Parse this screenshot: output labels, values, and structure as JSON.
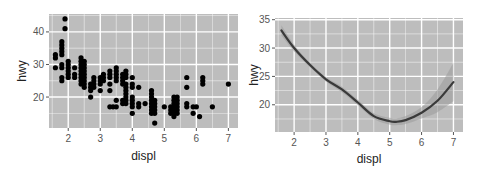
{
  "chart_data": [
    {
      "type": "scatter",
      "title": "",
      "xlabel": "displ",
      "ylabel": "hwy",
      "xlim": [
        1.4,
        7.3
      ],
      "ylim": [
        10.5,
        45.5
      ],
      "x_ticks": [
        2,
        3,
        4,
        5,
        6,
        7
      ],
      "y_ticks": [
        20,
        30,
        40
      ],
      "grid": true,
      "legend": "none",
      "panel_background": "#bdbdbd",
      "point_color": "#000000",
      "points": [
        [
          1.6,
          33
        ],
        [
          1.6,
          32
        ],
        [
          1.6,
          29
        ],
        [
          1.8,
          37
        ],
        [
          1.8,
          36
        ],
        [
          1.8,
          35
        ],
        [
          1.8,
          34
        ],
        [
          1.8,
          33
        ],
        [
          1.8,
          30
        ],
        [
          1.8,
          29
        ],
        [
          1.8,
          26
        ],
        [
          1.8,
          25
        ],
        [
          1.9,
          44
        ],
        [
          1.9,
          41
        ],
        [
          2.0,
          31
        ],
        [
          2.0,
          30
        ],
        [
          2.0,
          29
        ],
        [
          2.0,
          28
        ],
        [
          2.0,
          27
        ],
        [
          2.0,
          26
        ],
        [
          2.2,
          29
        ],
        [
          2.2,
          27
        ],
        [
          2.2,
          26
        ],
        [
          2.4,
          32
        ],
        [
          2.4,
          31
        ],
        [
          2.4,
          30
        ],
        [
          2.4,
          29
        ],
        [
          2.4,
          28
        ],
        [
          2.4,
          27
        ],
        [
          2.4,
          26
        ],
        [
          2.4,
          25
        ],
        [
          2.4,
          24
        ],
        [
          2.5,
          31
        ],
        [
          2.5,
          30
        ],
        [
          2.5,
          29
        ],
        [
          2.5,
          28
        ],
        [
          2.5,
          27
        ],
        [
          2.5,
          26
        ],
        [
          2.5,
          25
        ],
        [
          2.5,
          24
        ],
        [
          2.5,
          23
        ],
        [
          2.7,
          24
        ],
        [
          2.7,
          23
        ],
        [
          2.7,
          22
        ],
        [
          2.7,
          20
        ],
        [
          2.8,
          26
        ],
        [
          2.8,
          25
        ],
        [
          2.8,
          24
        ],
        [
          2.8,
          23
        ],
        [
          3.0,
          26
        ],
        [
          3.0,
          25
        ],
        [
          3.0,
          24
        ],
        [
          3.0,
          22
        ],
        [
          3.1,
          27
        ],
        [
          3.1,
          26
        ],
        [
          3.1,
          25
        ],
        [
          3.3,
          28
        ],
        [
          3.3,
          27
        ],
        [
          3.3,
          26
        ],
        [
          3.3,
          24
        ],
        [
          3.3,
          22
        ],
        [
          3.3,
          17
        ],
        [
          3.4,
          17
        ],
        [
          3.5,
          29
        ],
        [
          3.5,
          28
        ],
        [
          3.5,
          27
        ],
        [
          3.5,
          26
        ],
        [
          3.5,
          25
        ],
        [
          3.5,
          19
        ],
        [
          3.5,
          17
        ],
        [
          3.7,
          27
        ],
        [
          3.7,
          26
        ],
        [
          3.7,
          25
        ],
        [
          3.7,
          24
        ],
        [
          3.7,
          19
        ],
        [
          3.7,
          18
        ],
        [
          3.8,
          28
        ],
        [
          3.8,
          27
        ],
        [
          3.8,
          26
        ],
        [
          3.8,
          24
        ],
        [
          3.8,
          23
        ],
        [
          3.8,
          22
        ],
        [
          3.8,
          21
        ],
        [
          3.8,
          20
        ],
        [
          3.8,
          19
        ],
        [
          3.8,
          18
        ],
        [
          4.0,
          26
        ],
        [
          4.0,
          24
        ],
        [
          4.0,
          23
        ],
        [
          4.0,
          20
        ],
        [
          4.0,
          19
        ],
        [
          4.0,
          18
        ],
        [
          4.0,
          17
        ],
        [
          4.0,
          15
        ],
        [
          4.2,
          23
        ],
        [
          4.2,
          18
        ],
        [
          4.2,
          17
        ],
        [
          4.4,
          18
        ],
        [
          4.6,
          22
        ],
        [
          4.6,
          21
        ],
        [
          4.6,
          20
        ],
        [
          4.6,
          19
        ],
        [
          4.6,
          18
        ],
        [
          4.6,
          17
        ],
        [
          4.6,
          16
        ],
        [
          4.6,
          15
        ],
        [
          4.7,
          19
        ],
        [
          4.7,
          18
        ],
        [
          4.7,
          17
        ],
        [
          4.7,
          16
        ],
        [
          4.7,
          15
        ],
        [
          4.7,
          12
        ],
        [
          5.0,
          17
        ],
        [
          5.2,
          17
        ],
        [
          5.2,
          16
        ],
        [
          5.2,
          15
        ],
        [
          5.3,
          20
        ],
        [
          5.3,
          19
        ],
        [
          5.3,
          18
        ],
        [
          5.3,
          17
        ],
        [
          5.3,
          16
        ],
        [
          5.3,
          15
        ],
        [
          5.3,
          14
        ],
        [
          5.4,
          20
        ],
        [
          5.4,
          19
        ],
        [
          5.4,
          18
        ],
        [
          5.4,
          17
        ],
        [
          5.4,
          16
        ],
        [
          5.4,
          15
        ],
        [
          5.7,
          26
        ],
        [
          5.7,
          23
        ],
        [
          5.7,
          18
        ],
        [
          5.7,
          17
        ],
        [
          5.9,
          17
        ],
        [
          5.9,
          15
        ],
        [
          6.0,
          17
        ],
        [
          6.1,
          14
        ],
        [
          6.2,
          26
        ],
        [
          6.2,
          25
        ],
        [
          6.2,
          24
        ],
        [
          6.5,
          17
        ],
        [
          7.0,
          24
        ]
      ]
    },
    {
      "type": "line",
      "subtype": "smooth (loess) with confidence band",
      "title": "",
      "xlabel": "displ",
      "ylabel": "hwy",
      "xlim": [
        1.4,
        7.3
      ],
      "ylim": [
        15.2,
        35.3
      ],
      "x_ticks": [
        2,
        3,
        4,
        5,
        6,
        7
      ],
      "y_ticks": [
        20,
        25,
        30,
        35
      ],
      "grid": true,
      "legend": "none",
      "panel_background": "#bdbdbd",
      "line_color": "#3a3a3a",
      "band_color": "#9a9a9a",
      "x": [
        1.6,
        2.0,
        2.5,
        3.0,
        3.5,
        4.0,
        4.5,
        5.0,
        5.2,
        5.5,
        6.0,
        6.5,
        7.0
      ],
      "y": [
        33.1,
        30.0,
        27.0,
        24.5,
        22.7,
        20.4,
        18.0,
        17.1,
        17.0,
        17.3,
        18.6,
        20.7,
        24.0
      ],
      "ci_lower": [
        32.2,
        29.4,
        26.6,
        24.1,
        22.2,
        19.9,
        17.5,
        16.5,
        16.4,
        16.6,
        17.6,
        18.7,
        20.6
      ],
      "ci_upper": [
        34.0,
        30.6,
        27.4,
        24.9,
        23.2,
        20.9,
        18.5,
        17.7,
        17.6,
        18.0,
        19.6,
        22.7,
        27.4
      ]
    }
  ]
}
